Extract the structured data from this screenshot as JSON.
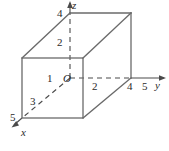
{
  "figure": {
    "kind": "3d-coordinate-box-diagram",
    "stroke_color": "#4a4a4a",
    "text_color": "#2a2a2a",
    "background_color": "#ffffff",
    "axes": [
      {
        "name": "z-axis",
        "label": "z",
        "direction": "up",
        "style": "dashed-inside-solid-outside"
      },
      {
        "name": "y-axis",
        "label": "y",
        "direction": "right",
        "style": "dashed-inside-solid-outside"
      },
      {
        "name": "x-axis",
        "label": "x",
        "direction": "down-left",
        "style": "dashed"
      }
    ],
    "axis_labels": {
      "x": "x",
      "y": "y",
      "z": "z"
    },
    "origin_label": "O",
    "z_ticks": [
      {
        "value": "4",
        "label": "4"
      },
      {
        "value": "2",
        "label": "2"
      }
    ],
    "y_ticks": [
      {
        "value": "2",
        "label": "2"
      },
      {
        "value": "4",
        "label": "4"
      },
      {
        "value": "5",
        "label": "5"
      }
    ],
    "x_ticks": [
      {
        "value": "1",
        "label": "1"
      },
      {
        "value": "3",
        "label": "3"
      },
      {
        "value": "5",
        "label": "5"
      }
    ],
    "box": {
      "name": "rectangular-box",
      "y_extent": "4",
      "z_extent": "4",
      "x_extent": "5"
    }
  }
}
